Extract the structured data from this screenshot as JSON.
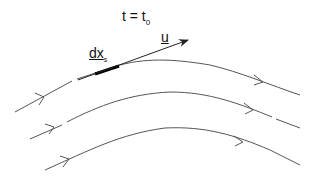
{
  "diagram": {
    "title_label": {
      "text": "t = t",
      "subscript": "0"
    },
    "velocity_label": "u",
    "element_label": {
      "text": "dx",
      "subscript": "s"
    },
    "streamlines": [
      {
        "name": "streamline-top",
        "direction": "left-to-right",
        "has_line_element": true
      },
      {
        "name": "streamline-middle",
        "direction": "left-to-right"
      },
      {
        "name": "streamline-bottom",
        "direction": "left-to-right"
      }
    ],
    "colors": {
      "line": "#555555",
      "element": "#000000",
      "text": "#111111"
    }
  }
}
